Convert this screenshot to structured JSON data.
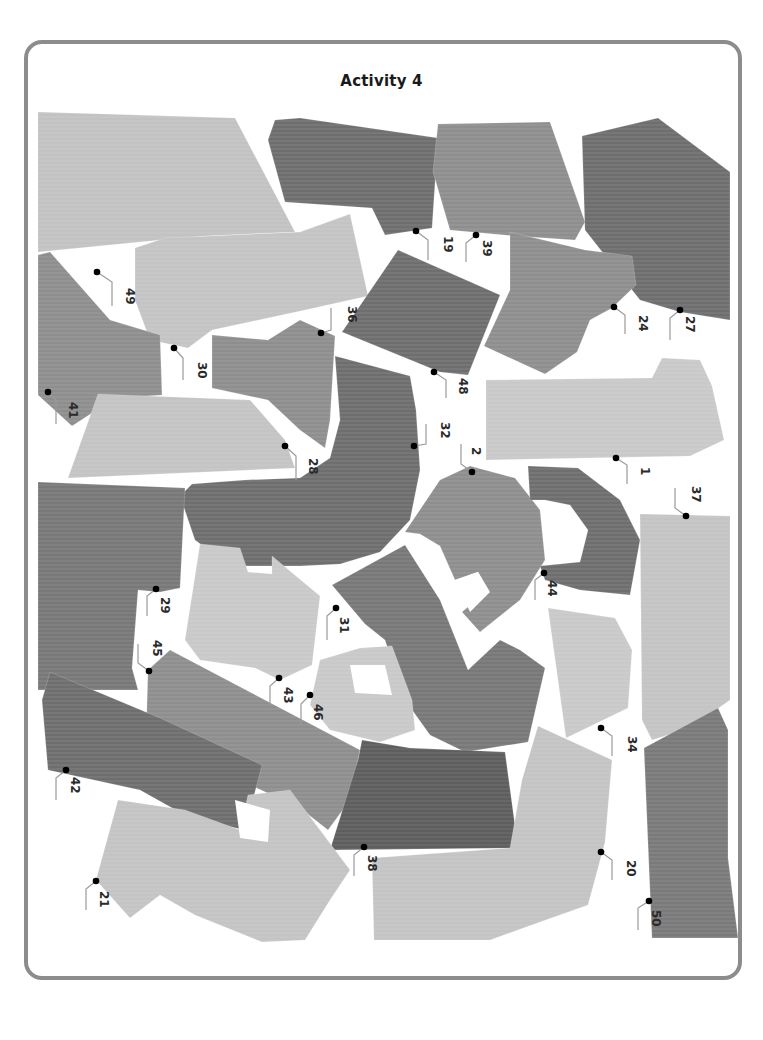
{
  "page": {
    "title": "Activity 4"
  },
  "colors": {
    "frame": "#8c8c8c",
    "background": "#ffffff",
    "dark": "#6b6b6b",
    "darker": "#5a5a5a",
    "medium": "#8a8a8a",
    "light": "#b9b9b9",
    "lighter": "#cccccc",
    "dot": "#000000",
    "leader": "#9a9a9a",
    "label": "#2a2a2a"
  },
  "pieces": [
    {
      "id": "49",
      "shade": "#c2c2c2",
      "points": "38,112 235,118 295,232 205,236 160,240 38,252"
    },
    {
      "id": "19",
      "shade": "#6e6e6e",
      "points": "275,120 300,118 438,138 432,228 385,235 372,208 285,202 268,140"
    },
    {
      "id": "39",
      "shade": "#8e8e8e",
      "points": "438,124 550,122 585,222 575,240 515,236 450,230 433,172"
    },
    {
      "id": "27",
      "shade": "#6e6e6e",
      "points": "582,136 658,118 730,172 730,320 680,312 640,300 585,230"
    },
    {
      "id": "36-30",
      "shade": "#c4c4c4",
      "points": "135,248 165,238 300,232 350,214 368,296 305,310 212,330 188,348 150,340 135,300"
    },
    {
      "id": "41",
      "shade": "#8e8e8e",
      "points": "38,255 50,252 110,320 160,335 162,395 115,398 72,426 38,395"
    },
    {
      "id": "48",
      "shade": "#6e6e6e",
      "points": "398,250 500,295 468,375 440,372 342,332"
    },
    {
      "id": "24",
      "shade": "#8e8e8e",
      "points": "510,232 585,250 632,256 636,285 612,308 590,320 577,352 545,374 484,346 510,290"
    },
    {
      "id": "36b",
      "shade": "#8e8e8e",
      "points": "212,335 268,340 300,320 335,336 330,420 325,448 300,430 268,400 212,388"
    },
    {
      "id": "28",
      "shade": "#c4c4c4",
      "points": "98,394 250,400 285,440 295,468 68,478"
    },
    {
      "id": "1",
      "shade": "#c9c9c9",
      "points": "486,380 652,378 662,358 700,360 712,386 724,440 690,456 486,460"
    },
    {
      "id": "32",
      "shade": "#6e6e6e",
      "points": "335,356 410,376 416,410 420,470 410,520 380,552 340,564 300,566 230,566 195,540 180,496 192,484 245,480 300,478 330,458 340,420"
    },
    {
      "id": "2",
      "shade": "#8e8e8e",
      "points": "440,480 470,466 515,478 540,510 545,560 520,600 480,632 462,612 488,590 478,572 455,580 440,546 420,534 405,532"
    },
    {
      "id": "44",
      "shade": "#6e6e6e",
      "points": "528,466 578,468 620,500 640,540 630,595 580,590 545,580 540,566 580,562 588,530 570,505 545,500 530,500"
    },
    {
      "id": "37",
      "shade": "#c4c4c4",
      "points": "640,514 730,516 730,700 690,728 652,740 642,720"
    },
    {
      "id": "29",
      "shade": "#787878",
      "points": "38,482 185,488 180,588 160,592 138,590 132,668 138,690 38,690"
    },
    {
      "id": "43",
      "shade": "#c9c9c9",
      "points": "200,544 240,548 248,572 272,574 272,556 320,596 312,665 280,680 255,668 200,660 185,640"
    },
    {
      "id": "31",
      "shade": "#787878",
      "points": "332,585 405,545 440,600 468,670 500,640 520,650 545,668 528,742 465,752 430,735 405,700 385,640 365,624"
    },
    {
      "id": "34",
      "shade": "#c9c9c9",
      "points": "548,608 615,618 632,650 628,708 566,738"
    },
    {
      "id": "46",
      "shade": "#c9c9c9",
      "points": "320,660 360,648 392,646 412,700 415,730 380,742 330,730 310,705"
    },
    {
      "id": "45",
      "shade": "#8e8e8e",
      "points": "148,670 170,650 360,750 350,800 328,830 300,808 218,770 146,740"
    },
    {
      "id": "42",
      "shade": "#6e6e6e",
      "points": "50,672 160,718 262,765 245,830 190,818 140,790 48,770 42,700"
    },
    {
      "id": "38",
      "shade": "#5e5e5e",
      "points": "362,740 410,748 505,752 518,848 330,850 358,760"
    },
    {
      "id": "20",
      "shade": "#c4c4c4",
      "points": "538,726 612,760 605,842 588,905 540,922 490,940 374,940 372,858 510,848 522,780"
    },
    {
      "id": "50",
      "shade": "#7a7a7a",
      "points": "644,748 718,708 728,730 728,858 738,938 652,938"
    },
    {
      "id": "21",
      "shade": "#c4c4c4",
      "points": "118,800 185,810 240,830 248,795 290,790 350,870 330,900 305,940 262,942 195,915 160,895 130,918 96,880"
    }
  ],
  "holes": [
    {
      "points": "235,800 270,810 268,842 240,838"
    },
    {
      "points": "350,665 385,665 392,695 355,693"
    },
    {
      "points": "455,580 478,572 490,592 470,612"
    }
  ],
  "labels": [
    {
      "text": "49",
      "dot": [
        97,
        272
      ],
      "lx": 124,
      "ly": 288,
      "line": [
        [
          97,
          272
        ],
        [
          112,
          282
        ],
        [
          112,
          306
        ]
      ]
    },
    {
      "text": "19",
      "dot": [
        416,
        231
      ],
      "lx": 442,
      "ly": 236,
      "line": [
        [
          416,
          231
        ],
        [
          428,
          240
        ],
        [
          428,
          260
        ]
      ]
    },
    {
      "text": "39",
      "dot": [
        476,
        235
      ],
      "lx": 481,
      "ly": 240,
      "line": [
        [
          476,
          235
        ],
        [
          466,
          243
        ],
        [
          466,
          262
        ]
      ]
    },
    {
      "text": "24",
      "dot": [
        614,
        307
      ],
      "lx": 637,
      "ly": 315,
      "line": [
        [
          614,
          307
        ],
        [
          625,
          315
        ],
        [
          625,
          334
        ]
      ]
    },
    {
      "text": "27",
      "dot": [
        680,
        310
      ],
      "lx": 684,
      "ly": 316,
      "line": [
        [
          680,
          310
        ],
        [
          670,
          318
        ],
        [
          670,
          340
        ]
      ]
    },
    {
      "text": "36",
      "dot": [
        321,
        333
      ],
      "lx": 346,
      "ly": 306,
      "line": [
        [
          321,
          333
        ],
        [
          331,
          330
        ],
        [
          331,
          308
        ]
      ]
    },
    {
      "text": "30",
      "dot": [
        174,
        348
      ],
      "lx": 196,
      "ly": 362,
      "line": [
        [
          174,
          348
        ],
        [
          183,
          358
        ],
        [
          183,
          380
        ]
      ]
    },
    {
      "text": "48",
      "dot": [
        434,
        372
      ],
      "lx": 457,
      "ly": 378,
      "line": [
        [
          434,
          372
        ],
        [
          446,
          380
        ],
        [
          446,
          398
        ]
      ]
    },
    {
      "text": "41",
      "dot": [
        48,
        392
      ],
      "lx": 67,
      "ly": 402,
      "line": [
        [
          48,
          392
        ],
        [
          56,
          400
        ],
        [
          56,
          424
        ]
      ]
    },
    {
      "text": "32",
      "dot": [
        414,
        446
      ],
      "lx": 439,
      "ly": 422,
      "line": [
        [
          414,
          446
        ],
        [
          426,
          444
        ],
        [
          426,
          424
        ]
      ]
    },
    {
      "text": "28",
      "dot": [
        285,
        446
      ],
      "lx": 307,
      "ly": 458,
      "line": [
        [
          285,
          446
        ],
        [
          296,
          456
        ],
        [
          296,
          480
        ]
      ]
    },
    {
      "text": "2",
      "dot": [
        472,
        472
      ],
      "lx": 470,
      "ly": 447,
      "line": [
        [
          472,
          472
        ],
        [
          461,
          464
        ],
        [
          461,
          444
        ]
      ]
    },
    {
      "text": "1",
      "dot": [
        616,
        458
      ],
      "lx": 639,
      "ly": 467,
      "line": [
        [
          616,
          458
        ],
        [
          627,
          465
        ],
        [
          627,
          484
        ]
      ]
    },
    {
      "text": "37",
      "dot": [
        686,
        516
      ],
      "lx": 690,
      "ly": 486,
      "line": [
        [
          686,
          516
        ],
        [
          675,
          508
        ],
        [
          675,
          488
        ]
      ]
    },
    {
      "text": "44",
      "dot": [
        544,
        573
      ],
      "lx": 546,
      "ly": 580,
      "line": [
        [
          544,
          573
        ],
        [
          535,
          580
        ],
        [
          535,
          600
        ]
      ]
    },
    {
      "text": "29",
      "dot": [
        156,
        589
      ],
      "lx": 159,
      "ly": 597,
      "line": [
        [
          156,
          589
        ],
        [
          147,
          596
        ],
        [
          147,
          616
        ]
      ]
    },
    {
      "text": "31",
      "dot": [
        336,
        608
      ],
      "lx": 338,
      "ly": 617,
      "line": [
        [
          336,
          608
        ],
        [
          327,
          616
        ],
        [
          327,
          640
        ]
      ]
    },
    {
      "text": "45",
      "dot": [
        149,
        671
      ],
      "lx": 151,
      "ly": 640,
      "line": [
        [
          149,
          671
        ],
        [
          138,
          663
        ],
        [
          138,
          644
        ]
      ]
    },
    {
      "text": "43",
      "dot": [
        279,
        678
      ],
      "lx": 282,
      "ly": 687,
      "line": [
        [
          279,
          678
        ],
        [
          270,
          686
        ],
        [
          270,
          706
        ]
      ]
    },
    {
      "text": "46",
      "dot": [
        310,
        695
      ],
      "lx": 312,
      "ly": 704,
      "line": [
        [
          310,
          695
        ],
        [
          301,
          704
        ],
        [
          301,
          724
        ]
      ]
    },
    {
      "text": "34",
      "dot": [
        601,
        728
      ],
      "lx": 626,
      "ly": 736,
      "line": [
        [
          601,
          728
        ],
        [
          612,
          736
        ],
        [
          612,
          756
        ]
      ]
    },
    {
      "text": "42",
      "dot": [
        66,
        770
      ],
      "lx": 69,
      "ly": 777,
      "line": [
        [
          66,
          770
        ],
        [
          56,
          778
        ],
        [
          56,
          800
        ]
      ]
    },
    {
      "text": "38",
      "dot": [
        364,
        847
      ],
      "lx": 366,
      "ly": 855,
      "line": [
        [
          364,
          847
        ],
        [
          354,
          855
        ],
        [
          354,
          876
        ]
      ]
    },
    {
      "text": "20",
      "dot": [
        601,
        852
      ],
      "lx": 625,
      "ly": 860,
      "line": [
        [
          601,
          852
        ],
        [
          612,
          860
        ],
        [
          612,
          880
        ]
      ]
    },
    {
      "text": "21",
      "dot": [
        96,
        881
      ],
      "lx": 98,
      "ly": 891,
      "line": [
        [
          96,
          881
        ],
        [
          86,
          889
        ],
        [
          86,
          910
        ]
      ]
    },
    {
      "text": "50",
      "dot": [
        649,
        901
      ],
      "lx": 650,
      "ly": 910,
      "line": [
        [
          649,
          901
        ],
        [
          638,
          908
        ],
        [
          638,
          930
        ]
      ]
    }
  ]
}
